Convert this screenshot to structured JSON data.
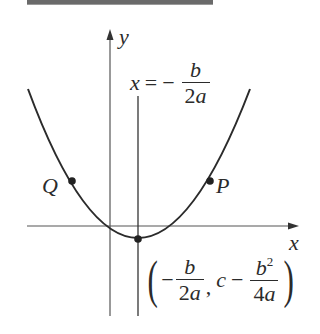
{
  "figure": {
    "axes": {
      "x_label": "x",
      "y_label": "y"
    },
    "axis_of_symmetry": {
      "lhs": "x",
      "equals": "=",
      "minus": "−",
      "numerator": "b",
      "denominator": "2a"
    },
    "points": [
      {
        "id": "Q",
        "label": "Q"
      },
      {
        "id": "P",
        "label": "P"
      }
    ],
    "vertex": {
      "open_paren": "(",
      "minus1": "−",
      "x_num": "b",
      "x_den": "2a",
      "comma": ",",
      "c": "c",
      "minus2": "−",
      "y_num_base": "b",
      "y_num_exp": "2",
      "y_den": "4a",
      "close_paren": ")"
    },
    "colors": {
      "ink": "#2b2b2b",
      "axis": "#555555",
      "topbar": "#6a6a6a"
    }
  }
}
